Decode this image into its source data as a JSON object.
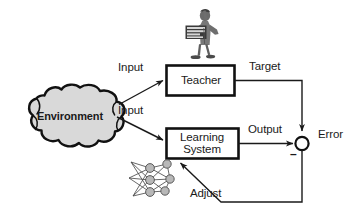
{
  "diagram": {
    "nodes": {
      "environment": {
        "label": "Environment",
        "shape": "cloud",
        "fill": "#d9d9d9",
        "stroke": "#000000"
      },
      "teacher": {
        "label": "Teacher",
        "shape": "rectangle",
        "fill": "#ffffff",
        "stroke": "#000000"
      },
      "learning_system": {
        "label_line1": "Learning",
        "label_line2": "System",
        "shape": "rectangle",
        "fill": "#ffffff",
        "stroke": "#000000"
      },
      "summing_junction": {
        "label": "",
        "shape": "circle",
        "fill": "#ffffff",
        "stroke": "#000000",
        "sign": "–"
      }
    },
    "edges": {
      "input_to_teacher": "Input",
      "input_to_learning_system": "Input",
      "teacher_to_junction": "Target",
      "learning_system_to_junction": "Output",
      "junction_output": "Error",
      "junction_to_learning_system": "Adjust"
    },
    "icons": {
      "teacher_figure": "person-with-book-icon",
      "neural_network": "neural-network-icon"
    },
    "colors": {
      "line": "#1a1a1a",
      "cloud_fill": "#d9d9d9",
      "box_fill": "#ffffff",
      "node_fill": "#b3b3b3",
      "text": "#1a1a1a"
    }
  }
}
